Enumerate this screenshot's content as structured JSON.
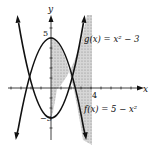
{
  "diagram": {
    "type": "function-graph",
    "axes": {
      "x_label": "x",
      "y_label": "y",
      "origin_px": [
        51,
        88
      ],
      "px_per_unit": 10,
      "x_range": [
        -5,
        8
      ],
      "y_range": [
        -5,
        8
      ]
    },
    "tick_labels": {
      "y_top": "5",
      "y_bottom": "−3",
      "x_right": "4"
    },
    "curves": [
      {
        "name": "g",
        "label": "g(x) = x² − 3",
        "expr": "x^2 - 3"
      },
      {
        "name": "f",
        "label": "f(x) = 5 − x²",
        "expr": "5 - x^2"
      }
    ],
    "shaded_region": {
      "from_x": 0,
      "to_x": 4,
      "between": [
        "f",
        "g"
      ]
    },
    "colors": {
      "stroke": "#111111",
      "shade": "#c8c8c8",
      "background": "#ffffff"
    }
  }
}
